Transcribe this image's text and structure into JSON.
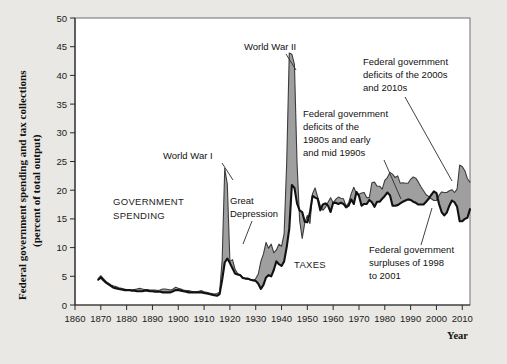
{
  "figure": {
    "background_color": "#e9e8e4",
    "plot_background": "#ffffff",
    "spending_line_color": "#3c3c3c",
    "taxes_line_color": "#111111",
    "deficit_fill_color": "#9a9a9a"
  },
  "labels": {
    "ytitle_line1": "Federal government spending and tax collections",
    "ytitle_line2": "(percent of total output)",
    "xtitle": "Year",
    "series_spending_line1": "GOVERNMENT",
    "series_spending_line2": "SPENDING",
    "series_taxes": "TAXES",
    "anno_ww1": "World War I",
    "anno_ww2": "World War II",
    "anno_depression_line1": "Great",
    "anno_depression_line2": "Depression",
    "anno_deficits80s_line1": "Federal government",
    "anno_deficits80s_line2": "deficits of the",
    "anno_deficits80s_line3": "1980s and early",
    "anno_deficits80s_line4": "and mid 1990s",
    "anno_deficits2000s_line1": "Federal government",
    "anno_deficits2000s_line2": "deficits of the 2000s",
    "anno_deficits2000s_line3": "and 2010s",
    "anno_surpluses_line1": "Federal government",
    "anno_surpluses_line2": "surpluses of 1998",
    "anno_surpluses_line3": "to 2001"
  },
  "chart_data": {
    "type": "area",
    "title": "",
    "subtitle": "",
    "xlabel": "Year",
    "ylabel": "Federal government spending and tax collections (percent of total output)",
    "xlim": [
      1860,
      2013
    ],
    "ylim": [
      0,
      50
    ],
    "grid": false,
    "legend_position": "in-plot annotations",
    "xticks": [
      1860,
      1870,
      1880,
      1890,
      1900,
      1910,
      1920,
      1930,
      1940,
      1950,
      1960,
      1970,
      1980,
      1990,
      2000,
      2010
    ],
    "yticks": [
      0,
      5,
      10,
      15,
      20,
      25,
      30,
      35,
      40,
      45,
      50
    ],
    "x": [
      1869,
      1870,
      1871,
      1872,
      1873,
      1874,
      1875,
      1876,
      1877,
      1878,
      1879,
      1880,
      1881,
      1882,
      1883,
      1884,
      1885,
      1886,
      1887,
      1888,
      1889,
      1890,
      1891,
      1892,
      1893,
      1894,
      1895,
      1896,
      1897,
      1898,
      1899,
      1900,
      1901,
      1902,
      1903,
      1904,
      1905,
      1906,
      1907,
      1908,
      1909,
      1910,
      1911,
      1912,
      1913,
      1914,
      1915,
      1916,
      1917,
      1918,
      1919,
      1920,
      1921,
      1922,
      1923,
      1924,
      1925,
      1926,
      1927,
      1928,
      1929,
      1930,
      1931,
      1932,
      1933,
      1934,
      1935,
      1936,
      1937,
      1938,
      1939,
      1940,
      1941,
      1942,
      1943,
      1944,
      1945,
      1946,
      1947,
      1948,
      1949,
      1950,
      1951,
      1952,
      1953,
      1954,
      1955,
      1956,
      1957,
      1958,
      1959,
      1960,
      1961,
      1962,
      1963,
      1964,
      1965,
      1966,
      1967,
      1968,
      1969,
      1970,
      1971,
      1972,
      1973,
      1974,
      1975,
      1976,
      1977,
      1978,
      1979,
      1980,
      1981,
      1982,
      1983,
      1984,
      1985,
      1986,
      1987,
      1988,
      1989,
      1990,
      1991,
      1992,
      1993,
      1994,
      1995,
      1996,
      1997,
      1998,
      1999,
      2000,
      2001,
      2002,
      2003,
      2004,
      2005,
      2006,
      2007,
      2008,
      2009,
      2010,
      2011,
      2012,
      2013
    ],
    "series": [
      {
        "name": "GOVERNMENT SPENDING",
        "color": "#3c3c3c",
        "values": [
          4.6,
          5.1,
          4.6,
          4.1,
          3.8,
          3.5,
          3.3,
          3.2,
          3.0,
          2.9,
          2.8,
          2.7,
          2.7,
          2.6,
          2.7,
          2.8,
          2.9,
          2.8,
          2.7,
          2.7,
          2.6,
          2.6,
          2.6,
          2.5,
          2.6,
          2.8,
          2.8,
          2.7,
          2.6,
          2.8,
          3.1,
          2.9,
          2.8,
          2.6,
          2.5,
          2.5,
          2.4,
          2.3,
          2.3,
          2.4,
          2.5,
          2.3,
          2.2,
          2.1,
          2.0,
          1.9,
          2.0,
          2.2,
          7.8,
          23.8,
          21.0,
          7.6,
          7.9,
          6.2,
          5.5,
          5.2,
          4.8,
          4.6,
          4.5,
          4.4,
          4.2,
          4.6,
          5.4,
          7.6,
          8.9,
          10.9,
          9.9,
          10.6,
          9.1,
          9.6,
          10.6,
          10.2,
          12.4,
          24.8,
          43.9,
          43.7,
          41.9,
          24.8,
          14.8,
          11.6,
          14.3,
          15.6,
          14.2,
          19.4,
          20.4,
          18.8,
          17.3,
          16.5,
          17.0,
          17.9,
          18.7,
          17.8,
          18.4,
          18.8,
          18.6,
          18.5,
          17.2,
          17.8,
          19.4,
          20.5,
          19.4,
          19.3,
          19.5,
          19.6,
          18.7,
          18.7,
          21.3,
          21.4,
          20.7,
          20.7,
          20.2,
          21.7,
          22.2,
          23.1,
          22.8,
          22.2,
          22.5,
          21.2,
          21.3,
          21.2,
          21.2,
          21.9,
          22.3,
          22.1,
          21.4,
          20.6,
          19.9,
          19.2,
          18.9,
          18.5,
          18.2,
          18.2,
          19.1,
          19.7,
          19.6,
          19.6,
          19.9,
          20.1,
          19.6,
          20.2,
          24.4,
          24.1,
          23.4,
          22.0,
          21.4
        ]
      },
      {
        "name": "TAXES",
        "color": "#111111",
        "values": [
          4.4,
          4.8,
          4.3,
          3.9,
          3.6,
          3.3,
          3.0,
          2.9,
          2.8,
          2.7,
          2.6,
          2.6,
          2.6,
          2.5,
          2.5,
          2.4,
          2.4,
          2.4,
          2.5,
          2.5,
          2.4,
          2.4,
          2.3,
          2.3,
          2.3,
          2.2,
          2.2,
          2.2,
          2.2,
          2.4,
          2.6,
          2.6,
          2.5,
          2.4,
          2.3,
          2.2,
          2.2,
          2.2,
          2.2,
          2.2,
          2.2,
          2.1,
          2.0,
          1.9,
          1.8,
          1.7,
          1.6,
          1.9,
          4.4,
          7.4,
          8.1,
          7.3,
          6.4,
          5.5,
          5.3,
          5.2,
          4.7,
          4.6,
          4.6,
          4.4,
          4.3,
          4.2,
          3.7,
          2.8,
          3.5,
          4.8,
          5.2,
          5.0,
          6.1,
          7.6,
          7.1,
          6.8,
          7.6,
          10.1,
          13.3,
          20.9,
          20.4,
          17.7,
          16.5,
          16.2,
          14.5,
          14.4,
          16.1,
          19.0,
          18.7,
          18.5,
          16.5,
          17.5,
          17.7,
          17.3,
          16.2,
          17.8,
          17.8,
          17.6,
          17.8,
          17.6,
          17.0,
          17.3,
          18.4,
          17.6,
          19.7,
          19.0,
          17.3,
          17.6,
          17.6,
          18.3,
          17.9,
          17.1,
          18.0,
          18.0,
          18.5,
          19.0,
          19.6,
          19.1,
          17.3,
          17.3,
          17.4,
          17.7,
          18.0,
          18.2,
          18.4,
          18.3,
          18.0,
          17.8,
          17.5,
          17.5,
          17.5,
          18.0,
          18.5,
          19.2,
          19.8,
          19.5,
          17.6,
          16.2,
          15.6,
          16.1,
          17.3,
          18.2,
          17.9,
          17.1,
          14.6,
          14.6,
          15.0,
          15.2,
          16.7
        ]
      }
    ],
    "annotations": [
      {
        "text": "World War I",
        "x": 1918,
        "y": 23.8
      },
      {
        "text": "World War II",
        "x": 1944,
        "y": 43.9
      },
      {
        "text": "Great Depression",
        "x": 1933,
        "y": 9.0
      },
      {
        "text": "GOVERNMENT SPENDING",
        "x": 1888,
        "y": 17.0
      },
      {
        "text": "TAXES",
        "x": 1951,
        "y": 8.5
      },
      {
        "text": "Federal government deficits of the 1980s and early and mid 1990s",
        "x": 1985,
        "y": 22.0
      },
      {
        "text": "Federal government deficits of the 2000s and 2010s",
        "x": 2009,
        "y": 24.0
      },
      {
        "text": "Federal government surpluses of 1998 to 2001",
        "x": 1999,
        "y": 19.8
      }
    ]
  }
}
